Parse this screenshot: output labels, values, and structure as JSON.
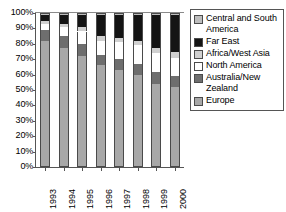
{
  "chart_data": {
    "type": "bar",
    "stacked": true,
    "stack_total": 100,
    "title": "",
    "subtitle": "",
    "xlabel": "",
    "ylabel": "",
    "grid": false,
    "legend_position": "right",
    "categories": [
      "1993",
      "1994",
      "1995",
      "1996",
      "1997",
      "1998",
      "1999",
      "2000"
    ],
    "ylim": [
      0,
      100
    ],
    "yticks": [
      "0%",
      "10%",
      "20%",
      "30%",
      "40%",
      "50%",
      "60%",
      "70%",
      "80%",
      "90%",
      "100%"
    ],
    "ytick_values": [
      0,
      10,
      20,
      30,
      40,
      50,
      60,
      70,
      80,
      90,
      100
    ],
    "series": [
      {
        "name": "Europe",
        "color": "#a8a8a8",
        "values": [
          82,
          77,
          72,
          66,
          63,
          60,
          54,
          52
        ]
      },
      {
        "name": "Australia/New Zealand",
        "color": "#6e6e6e",
        "values": [
          7,
          8,
          8,
          7,
          7,
          7,
          8,
          7
        ]
      },
      {
        "name": "North America",
        "color": "#ffffff",
        "values": [
          4,
          6,
          8,
          9,
          11,
          12,
          12,
          12
        ]
      },
      {
        "name": "Africa/West Asia",
        "color": "#d0d0d0",
        "values": [
          2,
          2,
          3,
          3,
          3,
          3,
          3,
          4
        ]
      },
      {
        "name": "Far East",
        "color": "#141414",
        "values": [
          4,
          6,
          8,
          14,
          15,
          17,
          22,
          24
        ]
      },
      {
        "name": "Central and South America",
        "color": "#bdbdbd",
        "values": [
          1,
          1,
          1,
          1,
          1,
          1,
          1,
          1
        ]
      }
    ],
    "legend_order": [
      "Central and South America",
      "Far East",
      "Africa/West Asia",
      "North America",
      "Australia/New Zealand",
      "Europe"
    ]
  },
  "legend": {
    "items": [
      {
        "label": "Central and South America",
        "color": "#bdbdbd"
      },
      {
        "label": "Far East",
        "color": "#141414"
      },
      {
        "label": "Africa/West Asia",
        "color": "#d0d0d0"
      },
      {
        "label": "North America",
        "color": "#ffffff"
      },
      {
        "label": "Australia/New Zealand",
        "color": "#6e6e6e"
      },
      {
        "label": "Europe",
        "color": "#a8a8a8"
      }
    ]
  },
  "colors": {
    "axis": "#555555",
    "outline": "#4a4a4a",
    "background": "#ffffff",
    "text": "#000000"
  }
}
